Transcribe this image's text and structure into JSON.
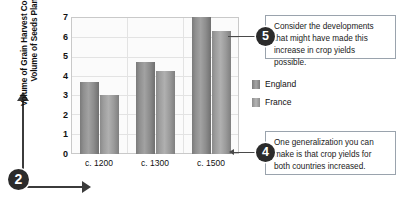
{
  "chart_data": {
    "type": "bar",
    "title": "",
    "xlabel": "",
    "ylabel": "Volume of Grain Harvest Compared to Volume of Seeds Planted",
    "categories": [
      "c. 1200",
      "c. 1300",
      "c. 1500"
    ],
    "series": [
      {
        "name": "England",
        "values": [
          3.7,
          4.7,
          7.0
        ]
      },
      {
        "name": "France",
        "values": [
          3.0,
          4.25,
          6.3
        ]
      }
    ],
    "ylim": [
      0,
      7
    ],
    "yticks": [
      "7",
      "6",
      "5",
      "4",
      "3",
      "2",
      "1",
      "0"
    ],
    "grid": true,
    "legend_position": "right"
  },
  "legend": {
    "items": [
      {
        "label": "England"
      },
      {
        "label": "France"
      }
    ]
  },
  "callouts": [
    {
      "number": "5",
      "text": "Consider the developments that might have made this increase in crop yields possible."
    },
    {
      "number": "4",
      "text": "One generalization you can make is that crop yields for both countries increased."
    }
  ],
  "markers": {
    "axes_marker": "2"
  }
}
